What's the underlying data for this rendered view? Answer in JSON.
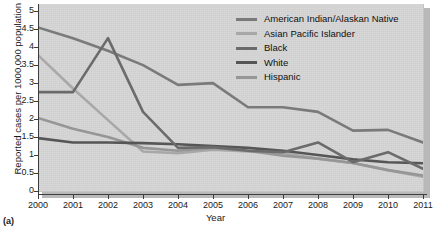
{
  "figure": {
    "caption": "(a)"
  },
  "chart_data": {
    "type": "line",
    "title": "",
    "xlabel": "Year",
    "ylabel": "Reported cases per 1000,000 population",
    "grid": false,
    "legend_position": "top-right",
    "x": [
      2000,
      2001,
      2002,
      2003,
      2004,
      2005,
      2006,
      2007,
      2008,
      2009,
      2010,
      2011
    ],
    "xtick_labels": [
      "2000",
      "2001",
      "2002",
      "2003",
      "2004",
      "2005",
      "2006",
      "2007",
      "2008",
      "2009",
      "2010",
      "2011"
    ],
    "xlim": [
      2000,
      2011
    ],
    "ylim": [
      0,
      5.2
    ],
    "ytick_labels": [
      "0",
      "0.5",
      "1",
      "1.5",
      "2",
      "2.5",
      "3",
      "3.5",
      "4",
      "4.5",
      "5"
    ],
    "yticks": [
      0,
      0.5,
      1,
      1.5,
      2,
      2.5,
      3,
      3.5,
      4,
      4.5,
      5
    ],
    "series": [
      {
        "name": "American Indian/Alaskan Native",
        "color": "#7a7a7a",
        "values": [
          4.55,
          4.25,
          3.9,
          3.5,
          2.95,
          3.0,
          2.33,
          2.33,
          2.2,
          1.68,
          1.7,
          1.35
        ]
      },
      {
        "name": "Asian Pacific Islander",
        "color": "#a8a8a8",
        "values": [
          3.78,
          2.85,
          1.97,
          1.1,
          1.05,
          1.15,
          1.1,
          1.05,
          0.9,
          0.78,
          0.58,
          0.4
        ]
      },
      {
        "name": "Black",
        "color": "#6b6b6b",
        "values": [
          2.75,
          2.75,
          4.25,
          2.2,
          1.2,
          1.22,
          1.12,
          1.08,
          1.35,
          0.8,
          1.08,
          0.62
        ]
      },
      {
        "name": "White",
        "color": "#565656",
        "values": [
          1.47,
          1.35,
          1.35,
          1.33,
          1.3,
          1.25,
          1.2,
          1.12,
          1.0,
          0.88,
          0.8,
          0.77
        ]
      },
      {
        "name": "Hispanic",
        "color": "#969696",
        "values": [
          2.03,
          1.73,
          1.5,
          1.2,
          1.12,
          1.2,
          1.12,
          0.98,
          0.9,
          0.78,
          0.58,
          0.43
        ]
      }
    ]
  }
}
